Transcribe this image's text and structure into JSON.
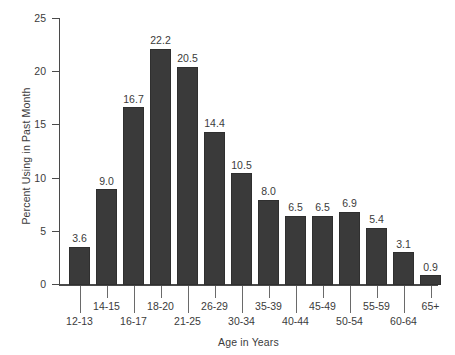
{
  "chart_data": {
    "type": "bar",
    "title": "",
    "xlabel": "Age in Years",
    "ylabel": "Percent Using in Past Month",
    "categories": [
      "12-13",
      "14-15",
      "16-17",
      "18-20",
      "21-25",
      "26-29",
      "30-34",
      "35-39",
      "40-44",
      "45-49",
      "50-54",
      "55-59",
      "60-64",
      "65+"
    ],
    "values": [
      3.6,
      9.0,
      16.7,
      22.2,
      20.5,
      14.4,
      10.5,
      8.0,
      6.5,
      6.5,
      6.9,
      5.4,
      3.1,
      0.9
    ],
    "value_labels": [
      "3.6",
      "9.0",
      "16.7",
      "22.2",
      "20.5",
      "14.4",
      "10.5",
      "8.0",
      "6.5",
      "6.5",
      "6.9",
      "5.4",
      "3.1",
      "0.9"
    ],
    "ylim": [
      0,
      25
    ],
    "ytick_values": [
      0,
      5,
      10,
      15,
      20,
      25
    ],
    "ytick_labels": [
      "0",
      "5",
      "10",
      "15",
      "20",
      "25"
    ],
    "grid": false,
    "legend": false,
    "bar_color": "#3a3a3a",
    "axis_color": "#4a4a4a",
    "text_color": "#3b3b3b",
    "background_color": "#ffffff",
    "xtick_label_stagger": [
      "lower",
      "upper",
      "lower",
      "upper",
      "lower",
      "upper",
      "lower",
      "upper",
      "lower",
      "upper",
      "lower",
      "upper",
      "lower",
      "upper"
    ]
  }
}
